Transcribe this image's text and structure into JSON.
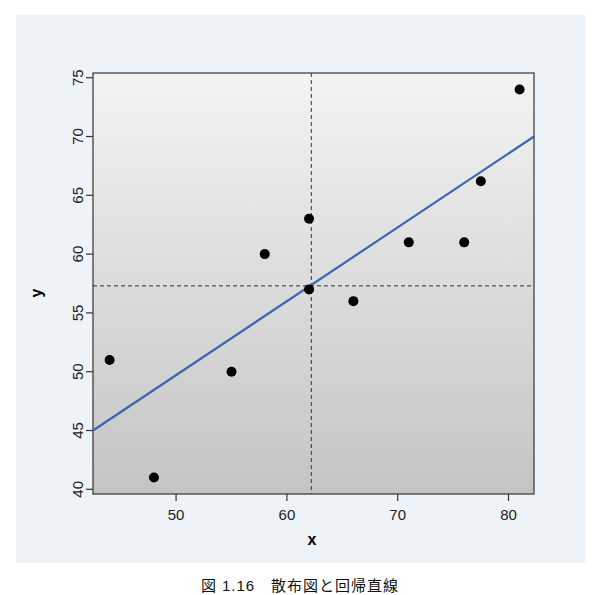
{
  "chart_data": {
    "type": "scatter",
    "title": "",
    "xlabel": "x",
    "ylabel": "y",
    "xlim": [
      42.5,
      82.3
    ],
    "ylim": [
      39.6,
      75.4
    ],
    "xticks": [
      50,
      60,
      70,
      80
    ],
    "yticks": [
      40,
      45,
      50,
      55,
      60,
      65,
      70,
      75
    ],
    "grid": false,
    "legend": null,
    "series": [
      {
        "name": "data",
        "type": "scatter",
        "points": [
          {
            "x": 44,
            "y": 51
          },
          {
            "x": 48,
            "y": 41
          },
          {
            "x": 55,
            "y": 50
          },
          {
            "x": 58,
            "y": 60
          },
          {
            "x": 62,
            "y": 63
          },
          {
            "x": 62,
            "y": 57
          },
          {
            "x": 66,
            "y": 56
          },
          {
            "x": 71,
            "y": 61
          },
          {
            "x": 76,
            "y": 61
          },
          {
            "x": 77.5,
            "y": 66.2
          },
          {
            "x": 81,
            "y": 74
          }
        ],
        "color": "#000000"
      },
      {
        "name": "regression line",
        "type": "line",
        "points": [
          {
            "x": 42.5,
            "y": 45.0
          },
          {
            "x": 82.3,
            "y": 70.0
          }
        ],
        "color": "#3a66b0"
      }
    ],
    "annotations": [
      {
        "type": "vline",
        "x": 62.2,
        "style": "dashed",
        "label": "mean of x"
      },
      {
        "type": "hline",
        "y": 57.3,
        "style": "dashed",
        "label": "mean of y"
      }
    ]
  },
  "caption": "図 1.16　散布図と回帰直線"
}
